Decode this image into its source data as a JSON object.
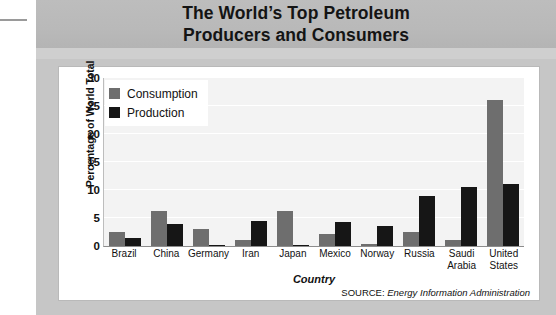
{
  "title": {
    "line1": "The World’s Top Petroleum",
    "line2": "Producers and Consumers"
  },
  "source": {
    "prefix": "SOURCE:",
    "name": "Energy Information Administration"
  },
  "colors": {
    "consumption": "#6e6e6e",
    "production": "#161616",
    "panel": "#c6c6c6",
    "title_band": "#b9b9b9",
    "plot_background": "#f3f3f3",
    "gridline": "#ffffff"
  },
  "chart_data": {
    "type": "bar",
    "title": "The World’s Top Petroleum Producers and Consumers",
    "xlabel": "Country",
    "ylabel": "Percentage of World Total",
    "ylim": [
      0,
      30
    ],
    "yticks": [
      0,
      5,
      10,
      15,
      20,
      25,
      30
    ],
    "grid": true,
    "legend_position": "top-left",
    "categories": [
      "Brazil",
      "China",
      "Germany",
      "Iran",
      "Japan",
      "Mexico",
      "Norway",
      "Russia",
      "Saudi Arabia",
      "United States"
    ],
    "series": [
      {
        "name": "Consumption",
        "color": "#6e6e6e",
        "values": [
          2.5,
          6.2,
          3.0,
          1.0,
          6.2,
          2.2,
          0.3,
          2.5,
          1.0,
          26.0
        ]
      },
      {
        "name": "Production",
        "color": "#161616",
        "values": [
          1.5,
          4.0,
          0.2,
          4.5,
          0.2,
          4.2,
          3.5,
          9.0,
          10.5,
          11.0
        ]
      }
    ]
  }
}
